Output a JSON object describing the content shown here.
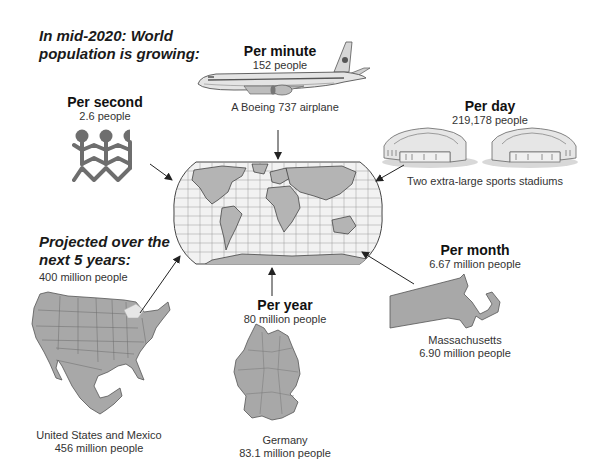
{
  "header": {
    "line1": "In mid-2020: World",
    "line2": "population is growing:"
  },
  "per_second": {
    "title": "Per second",
    "value": "2.6 people",
    "icon": "people-chain-icon"
  },
  "per_minute": {
    "title": "Per minute",
    "value": "152 people",
    "caption": "A Boeing 737 airplane",
    "icon": "airplane-icon"
  },
  "per_day": {
    "title": "Per day",
    "value": "219,178 people",
    "caption": "Two extra-large sports stadiums",
    "icon": "stadium-icon"
  },
  "per_month": {
    "title": "Per month",
    "value": "6.67 million people",
    "caption_line1": "Massachusetts",
    "caption_line2": "6.90 million people",
    "icon": "massachusetts-map-icon"
  },
  "per_year": {
    "title": "Per year",
    "value": "80 million people",
    "caption_line1": "Germany",
    "caption_line2": "83.1 million people",
    "icon": "germany-map-icon"
  },
  "projected": {
    "line1": "Projected over the",
    "line2": "next 5 years:",
    "value": "400 million people",
    "caption_line1": "United States and Mexico",
    "caption_line2": "456 million people",
    "icon": "us-mexico-map-icon"
  },
  "center": {
    "icon": "world-map-icon"
  },
  "colors": {
    "map_fill": "#a8a8a8",
    "map_stroke": "#555555",
    "icon_gray": "#6e6e6e",
    "ocean": "#f2f2f2",
    "arrow": "#222222"
  }
}
